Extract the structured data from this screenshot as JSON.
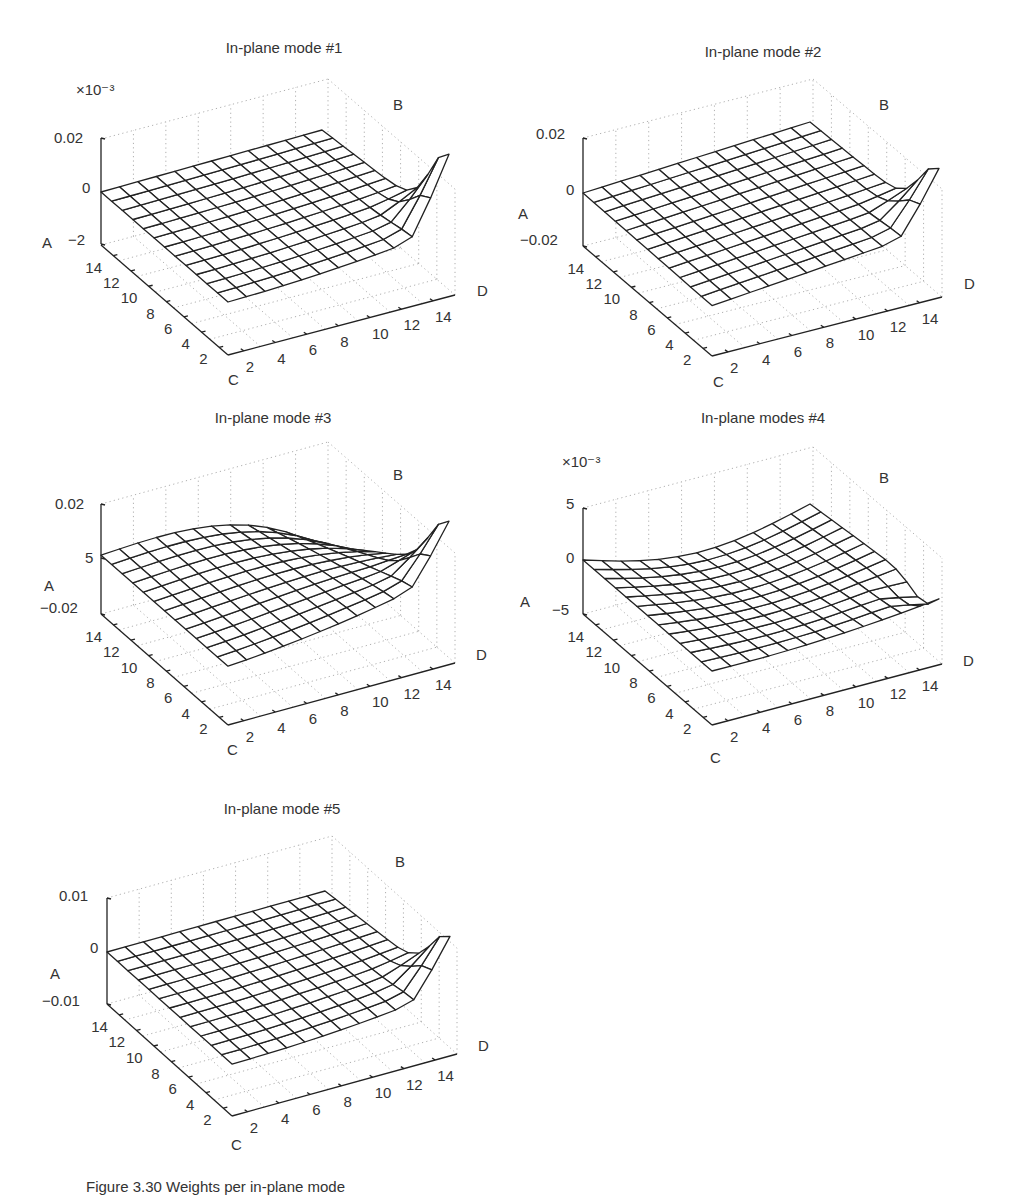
{
  "figure": {
    "caption": "Figure 3.30  Weights per in-plane mode"
  },
  "axes_labels": {
    "z": "A",
    "back": "B",
    "near": "C",
    "right": "D"
  },
  "chart_data": [
    {
      "type": "surface",
      "title": "In-plane mode #1",
      "xlabel": "D",
      "ylabel": "C",
      "zlabel": "A",
      "corner_label": "B",
      "x_ticks": [
        "2",
        "4",
        "6",
        "8",
        "10",
        "12",
        "14"
      ],
      "y_ticks": [
        "2",
        "4",
        "6",
        "8",
        "10",
        "12",
        "14"
      ],
      "z_ticks": [
        "0.02",
        "0",
        "−2"
      ],
      "z_multiplier": "×10⁻³",
      "zlim": [
        -2,
        0.02
      ],
      "grid": true,
      "shape": "flat_with_corner_spike",
      "params": {
        "tilt": 0.0,
        "spike": -3.2,
        "spike_up": 1.6,
        "edge_drop": -0.5
      }
    },
    {
      "type": "surface",
      "title": "In-plane mode #2",
      "xlabel": "D",
      "ylabel": "C",
      "zlabel": "A",
      "corner_label": "B",
      "x_ticks": [
        "2",
        "4",
        "6",
        "8",
        "10",
        "12",
        "14"
      ],
      "y_ticks": [
        "2",
        "4",
        "6",
        "8",
        "10",
        "12",
        "14"
      ],
      "z_ticks": [
        "0.02",
        "0",
        "−0.02"
      ],
      "z_multiplier": "",
      "zlim": [
        -0.02,
        0.02
      ],
      "grid": true,
      "shape": "tilted_plane_corner_drop",
      "params": {
        "tilt": 0.004,
        "spike": -0.024
      }
    },
    {
      "type": "surface",
      "title": "In-plane mode #3",
      "xlabel": "D",
      "ylabel": "C",
      "zlabel": "A",
      "corner_label": "B",
      "x_ticks": [
        "2",
        "4",
        "6",
        "8",
        "10",
        "12",
        "14"
      ],
      "y_ticks": [
        "2",
        "4",
        "6",
        "8",
        "10",
        "12",
        "14"
      ],
      "z_ticks": [
        "0.02",
        "5",
        "−0.02"
      ],
      "z_multiplier": "",
      "zlim": [
        -0.02,
        0.02
      ],
      "grid": true,
      "shape": "saddle_raised_back",
      "params": {
        "rise": 0.028,
        "spike": -0.02
      }
    },
    {
      "type": "surface",
      "title": "In-plane modes #4",
      "xlabel": "D",
      "ylabel": "C",
      "zlabel": "A",
      "corner_label": "B",
      "x_ticks": [
        "2",
        "4",
        "6",
        "8",
        "10",
        "12",
        "14"
      ],
      "y_ticks": [
        "2",
        "4",
        "6",
        "8",
        "10",
        "12",
        "14"
      ],
      "z_ticks": [
        "5",
        "0",
        "−5"
      ],
      "z_multiplier": "×10⁻³",
      "zlim": [
        -5,
        5
      ],
      "grid": true,
      "shape": "dome_corner_wave",
      "params": {
        "dome": 2.0,
        "spike": -2.5,
        "spike_up": 2.0
      }
    },
    {
      "type": "surface",
      "title": "In-plane mode #5",
      "xlabel": "D",
      "ylabel": "C",
      "zlabel": "A",
      "corner_label": "B",
      "x_ticks": [
        "2",
        "4",
        "6",
        "8",
        "10",
        "12",
        "14"
      ],
      "y_ticks": [
        "2",
        "4",
        "6",
        "8",
        "10",
        "12",
        "14"
      ],
      "z_ticks": [
        "0.01",
        "0",
        "−0.01"
      ],
      "z_multiplier": "",
      "zlim": [
        -0.01,
        0.01
      ],
      "grid": true,
      "shape": "flat_corner_drop",
      "params": {
        "tilt": 0.0,
        "spike": -0.013,
        "edge_drop": -0.003
      }
    }
  ],
  "layout": {
    "panels": [
      {
        "x": 0,
        "y": 0,
        "title_x": 252,
        "title_y": 37
      },
      {
        "x": 500,
        "y": 0,
        "title_x": 263,
        "title_y": 41
      },
      {
        "x": 0,
        "y": 400,
        "title_x": 273,
        "title_y": 7
      },
      {
        "x": 500,
        "y": 400,
        "title_x": 263,
        "title_y": 7
      },
      {
        "x": 0,
        "y": 790,
        "title_x": 282,
        "title_y": 8
      }
    ]
  }
}
